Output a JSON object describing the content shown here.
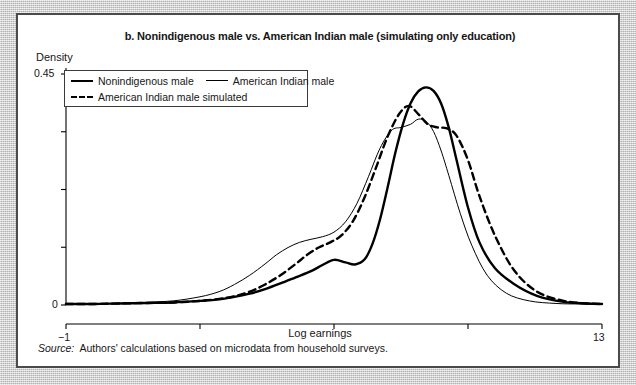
{
  "figure": {
    "title": "b. Nonindigenous male vs. American Indian male (simulating only education)",
    "source_prefix": "Source:",
    "source_text": "Authors' calculations based on microdata from household surveys."
  },
  "legend": {
    "items": [
      {
        "label": "Nonindigenous male",
        "style": "solid-thick",
        "color": "#000000"
      },
      {
        "label": "American Indian male",
        "style": "solid-thin",
        "color": "#000000"
      },
      {
        "label": "American Indian male simulated",
        "style": "dashed",
        "color": "#000000"
      }
    ]
  },
  "chart_data": {
    "type": "line",
    "title": "b. Nonindigenous male vs. American Indian male (simulating only education)",
    "xlabel": "Log earnings",
    "ylabel": "Density",
    "xlim": [
      -1,
      13
    ],
    "ylim": [
      0,
      0.45
    ],
    "xticks": [
      -1,
      2.5,
      6,
      9.5,
      13
    ],
    "xtick_labels": [
      "−1",
      "",
      "",
      "",
      "13"
    ],
    "yticks": [
      0,
      0.1125,
      0.225,
      0.3375,
      0.45
    ],
    "ytick_labels": [
      "0",
      "",
      "",
      "",
      "0.45"
    ],
    "grid": false,
    "legend_position": "upper-left",
    "series": [
      {
        "name": "Nonindigenous male",
        "style": "solid-thick",
        "color": "#000000",
        "x": [
          -1.0,
          -0.3,
          0.4,
          1.1,
          1.8,
          2.5,
          3.0,
          3.4,
          3.8,
          4.2,
          4.6,
          5.0,
          5.4,
          5.7,
          6.0,
          6.3,
          6.55,
          6.8,
          7.0,
          7.2,
          7.4,
          7.6,
          7.8,
          8.0,
          8.2,
          8.4,
          8.6,
          8.8,
          9.0,
          9.2,
          9.5,
          9.8,
          10.2,
          10.7,
          11.3,
          12.0,
          12.6,
          13.0
        ],
        "y": [
          0.002,
          0.002,
          0.003,
          0.004,
          0.005,
          0.008,
          0.011,
          0.016,
          0.022,
          0.031,
          0.042,
          0.054,
          0.066,
          0.078,
          0.088,
          0.083,
          0.079,
          0.089,
          0.118,
          0.166,
          0.229,
          0.296,
          0.352,
          0.393,
          0.416,
          0.424,
          0.417,
          0.392,
          0.345,
          0.283,
          0.19,
          0.122,
          0.072,
          0.041,
          0.018,
          0.006,
          0.003,
          0.002
        ]
      },
      {
        "name": "American Indian male",
        "style": "solid-thin",
        "color": "#000000",
        "x": [
          -1.0,
          -0.3,
          0.4,
          1.1,
          1.8,
          2.5,
          3.0,
          3.4,
          3.8,
          4.2,
          4.5,
          4.8,
          5.1,
          5.4,
          5.7,
          6.0,
          6.3,
          6.6,
          6.9,
          7.2,
          7.5,
          7.75,
          8.0,
          8.2,
          8.4,
          8.6,
          8.8,
          9.0,
          9.3,
          9.6,
          10.0,
          10.5,
          11.1,
          11.8,
          12.4,
          13.0
        ],
        "y": [
          0.002,
          0.002,
          0.003,
          0.005,
          0.008,
          0.016,
          0.026,
          0.04,
          0.058,
          0.08,
          0.098,
          0.112,
          0.122,
          0.128,
          0.133,
          0.142,
          0.162,
          0.198,
          0.25,
          0.305,
          0.34,
          0.346,
          0.352,
          0.362,
          0.358,
          0.338,
          0.3,
          0.252,
          0.178,
          0.116,
          0.058,
          0.023,
          0.008,
          0.003,
          0.002,
          0.002
        ]
      },
      {
        "name": "American Indian male simulated",
        "style": "dashed",
        "color": "#000000",
        "x": [
          -1.0,
          -0.3,
          0.4,
          1.1,
          1.8,
          2.5,
          3.0,
          3.4,
          3.8,
          4.2,
          4.6,
          5.0,
          5.3,
          5.6,
          5.9,
          6.2,
          6.5,
          6.8,
          7.1,
          7.4,
          7.7,
          7.95,
          8.2,
          8.45,
          8.7,
          8.95,
          9.2,
          9.5,
          9.8,
          10.2,
          10.7,
          11.3,
          12.0,
          12.6,
          13.0
        ],
        "y": [
          0.002,
          0.002,
          0.003,
          0.004,
          0.005,
          0.008,
          0.012,
          0.017,
          0.026,
          0.04,
          0.058,
          0.08,
          0.098,
          0.112,
          0.122,
          0.136,
          0.164,
          0.21,
          0.268,
          0.328,
          0.372,
          0.388,
          0.372,
          0.352,
          0.346,
          0.344,
          0.33,
          0.282,
          0.212,
          0.136,
          0.068,
          0.026,
          0.008,
          0.003,
          0.002
        ]
      }
    ]
  },
  "axes": {
    "x_tick_labels": [
      {
        "value": "−1",
        "x_px": 46
      },
      {
        "value": "13",
        "x_px": 582
      }
    ],
    "y_tick_labels": [
      {
        "value": "0.45",
        "y_px": 52
      },
      {
        "value": "0",
        "y_px": 283
      }
    ]
  }
}
